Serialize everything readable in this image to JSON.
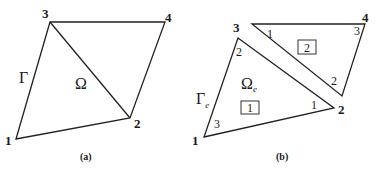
{
  "panel_a": {
    "caption": "(a)",
    "nodes": [
      {
        "label": "1",
        "x": 16,
        "y": 139,
        "lx": 6,
        "ly": 144
      },
      {
        "label": "2",
        "x": 130,
        "y": 118,
        "lx": 135,
        "ly": 127
      },
      {
        "label": "3",
        "x": 50,
        "y": 22,
        "lx": 42,
        "ly": 18
      },
      {
        "label": "4",
        "x": 165,
        "y": 22,
        "lx": 166,
        "ly": 22
      }
    ],
    "boundary_label": "Γ",
    "domain_label": "Ω"
  },
  "panel_b": {
    "caption": "(b)",
    "global_nodes": [
      {
        "label": "1",
        "lx": 193,
        "ly": 144
      },
      {
        "label": "2",
        "lx": 339,
        "ly": 113
      },
      {
        "label": "3",
        "lx": 233,
        "ly": 31
      },
      {
        "label": "4",
        "lx": 362,
        "ly": 22
      }
    ],
    "element_1": {
      "id": "1",
      "local_nodes": [
        {
          "label": "1",
          "lx": 313,
          "ly": 108
        },
        {
          "label": "2",
          "lx": 236,
          "ly": 55
        },
        {
          "label": "3",
          "lx": 213,
          "ly": 128
        }
      ]
    },
    "element_2": {
      "id": "2",
      "local_nodes": [
        {
          "label": "1",
          "lx": 267,
          "ly": 38
        },
        {
          "label": "2",
          "lx": 332,
          "ly": 84
        },
        {
          "label": "3",
          "lx": 354,
          "ly": 34
        }
      ]
    },
    "boundary_label": "Γ",
    "boundary_sub": "e",
    "domain_label": "Ω",
    "domain_sub": "e"
  },
  "colors": {
    "line": "#222222",
    "text": "#1a1a1a"
  }
}
